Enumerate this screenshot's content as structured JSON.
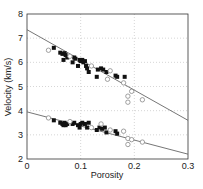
{
  "chart_data": {
    "type": "scatter",
    "title": "",
    "xlabel": "Porosity",
    "ylabel": "Velocity (km/s)",
    "xlim": [
      0,
      0.3
    ],
    "ylim": [
      2,
      8
    ],
    "x_ticks": [
      "0",
      "0.1",
      "0.2",
      "0.3"
    ],
    "y_ticks": [
      "2",
      "3",
      "4",
      "5",
      "6",
      "7",
      "8"
    ],
    "grid": true,
    "legend": null,
    "fit_lines": [
      {
        "name": "Vp trend",
        "x": [
          0,
          0.3
        ],
        "y": [
          7.35,
          3.6
        ]
      },
      {
        "name": "Vs trend",
        "x": [
          0,
          0.3
        ],
        "y": [
          3.95,
          2.2
        ]
      }
    ],
    "series": [
      {
        "name": "Vp filled",
        "marker": "filled-square",
        "points": [
          [
            0.05,
            6.6
          ],
          [
            0.062,
            6.4
          ],
          [
            0.066,
            6.35
          ],
          [
            0.07,
            6.38
          ],
          [
            0.072,
            6.3
          ],
          [
            0.068,
            6.1
          ],
          [
            0.075,
            6.2
          ],
          [
            0.085,
            6.0
          ],
          [
            0.088,
            6.2
          ],
          [
            0.09,
            6.15
          ],
          [
            0.095,
            5.85
          ],
          [
            0.098,
            6.1
          ],
          [
            0.1,
            6.05
          ],
          [
            0.103,
            6.1
          ],
          [
            0.105,
            6.0
          ],
          [
            0.108,
            6.05
          ],
          [
            0.11,
            5.85
          ],
          [
            0.112,
            5.75
          ],
          [
            0.115,
            5.6
          ],
          [
            0.13,
            5.4
          ],
          [
            0.132,
            5.7
          ],
          [
            0.138,
            5.75
          ],
          [
            0.142,
            5.7
          ],
          [
            0.148,
            5.6
          ],
          [
            0.165,
            5.45
          ],
          [
            0.168,
            5.4
          ],
          [
            0.182,
            5.4
          ]
        ]
      },
      {
        "name": "Vp open",
        "marker": "open-circle",
        "points": [
          [
            0.04,
            6.5
          ],
          [
            0.08,
            6.25
          ],
          [
            0.12,
            5.85
          ],
          [
            0.15,
            5.3
          ],
          [
            0.155,
            5.65
          ],
          [
            0.18,
            5.15
          ],
          [
            0.188,
            4.6
          ],
          [
            0.188,
            4.35
          ],
          [
            0.195,
            4.8
          ],
          [
            0.215,
            4.45
          ]
        ]
      },
      {
        "name": "Vs filled",
        "marker": "filled-square",
        "points": [
          [
            0.05,
            3.6
          ],
          [
            0.062,
            3.5
          ],
          [
            0.066,
            3.45
          ],
          [
            0.07,
            3.5
          ],
          [
            0.072,
            3.4
          ],
          [
            0.068,
            3.4
          ],
          [
            0.075,
            3.45
          ],
          [
            0.085,
            3.45
          ],
          [
            0.088,
            3.5
          ],
          [
            0.095,
            3.4
          ],
          [
            0.098,
            3.3
          ],
          [
            0.1,
            3.45
          ],
          [
            0.103,
            3.5
          ],
          [
            0.108,
            3.45
          ],
          [
            0.112,
            3.3
          ],
          [
            0.115,
            3.5
          ],
          [
            0.13,
            3.2
          ],
          [
            0.135,
            3.3
          ],
          [
            0.14,
            3.25
          ],
          [
            0.145,
            3.3
          ],
          [
            0.148,
            3.1
          ],
          [
            0.165,
            3.15
          ],
          [
            0.168,
            3.05
          ]
        ]
      },
      {
        "name": "Vs open",
        "marker": "open-circle",
        "points": [
          [
            0.04,
            3.7
          ],
          [
            0.08,
            3.55
          ],
          [
            0.12,
            3.3
          ],
          [
            0.138,
            3.45
          ],
          [
            0.155,
            3.2
          ],
          [
            0.18,
            3.15
          ],
          [
            0.188,
            2.85
          ],
          [
            0.188,
            2.6
          ],
          [
            0.195,
            2.8
          ],
          [
            0.215,
            2.7
          ]
        ]
      }
    ]
  }
}
